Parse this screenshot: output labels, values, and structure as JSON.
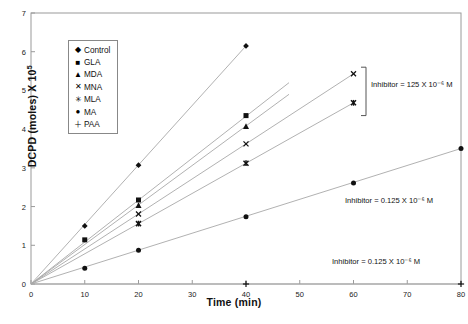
{
  "chart_data": {
    "type": "line",
    "title": "",
    "xlabel": "Time (min)",
    "ylabel": "DCPD (moles) X 10",
    "ylabel_exponent": "5",
    "xlim": [
      0,
      80
    ],
    "ylim": [
      0,
      7
    ],
    "xticks": [
      0,
      10,
      20,
      30,
      40,
      50,
      60,
      70,
      80
    ],
    "yticks": [
      0,
      1,
      2,
      3,
      4,
      5,
      6,
      7
    ],
    "grid": false,
    "legend_position": "upper-left-inside",
    "series": [
      {
        "name": "Control",
        "marker": "diamond",
        "x": [
          0,
          10,
          20,
          40
        ],
        "y": [
          0,
          1.5,
          3.07,
          6.15
        ]
      },
      {
        "name": "GLA",
        "marker": "square",
        "x": [
          0,
          10,
          20,
          40
        ],
        "y": [
          0,
          1.14,
          2.17,
          4.35
        ],
        "line_end_x": 48,
        "line_end_y": 5.2
      },
      {
        "name": "MDA",
        "marker": "triangle",
        "x": [
          0,
          20,
          40
        ],
        "y": [
          0,
          2.03,
          4.07
        ],
        "line_end_x": 48,
        "line_end_y": 4.9
      },
      {
        "name": "MNA",
        "marker": "cross",
        "x": [
          0,
          20,
          40,
          60
        ],
        "y": [
          0,
          1.81,
          3.62,
          5.43
        ]
      },
      {
        "name": "MLA",
        "marker": "star",
        "x": [
          0,
          20,
          40,
          60
        ],
        "y": [
          0,
          1.56,
          3.12,
          4.68
        ]
      },
      {
        "name": "MA",
        "marker": "circle",
        "x": [
          0,
          10,
          20,
          40,
          60,
          80
        ],
        "y": [
          0,
          0.41,
          0.87,
          1.74,
          2.61,
          3.5
        ]
      },
      {
        "name": "PAA",
        "marker": "plus",
        "x": [
          0,
          40,
          80
        ],
        "y": [
          0,
          0.0,
          0.0
        ]
      }
    ],
    "annotations": [
      {
        "id": "annot-top",
        "text": "Inhibitor = 125 X 10⁻⁶ M",
        "bracket": true
      },
      {
        "id": "annot-mid",
        "text": "Inhibitor = 0.125 X 10⁻⁶ M",
        "bracket": false
      },
      {
        "id": "annot-bot",
        "text": "Inhibitor = 0.125 X 10⁻⁶ M",
        "bracket": false
      }
    ]
  },
  "legend": {
    "items": [
      {
        "label": "Control",
        "mark": "◆"
      },
      {
        "label": "GLA",
        "mark": "■"
      },
      {
        "label": "MDA",
        "mark": "▲"
      },
      {
        "label": "MNA",
        "mark": "✕"
      },
      {
        "label": "MLA",
        "mark": "✳"
      },
      {
        "label": "MA",
        "mark": "●"
      },
      {
        "label": "PAA",
        "mark": "＋"
      }
    ]
  },
  "axes": {
    "x_title": "Time (min)",
    "y_title_main": "DCPD (moles) X 10",
    "y_title_sup": "5",
    "x_tick_labels": [
      "0",
      "10",
      "20",
      "30",
      "40",
      "50",
      "60",
      "70",
      "80"
    ],
    "y_tick_labels": [
      "0",
      "1",
      "2",
      "3",
      "4",
      "5",
      "6",
      "7"
    ]
  },
  "annotations": {
    "top": "Inhibitor = 125 X 10⁻⁶ M",
    "middle": "Inhibitor = 0.125 X 10⁻⁶ M",
    "bottom": "Inhibitor = 0.125 X 10⁻⁶ M"
  },
  "caption": "",
  "colors": {
    "line": "#a8a8a8",
    "axis": "#9a9a9a",
    "marker": "#111111",
    "text": "#111111",
    "legend_border": "#888888"
  }
}
